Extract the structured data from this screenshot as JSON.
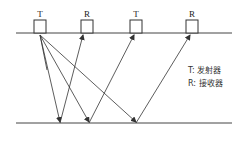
{
  "diagram": {
    "transducers": [
      {
        "label": "T",
        "type": "transmitter"
      },
      {
        "label": "R",
        "type": "receiver"
      },
      {
        "label": "T",
        "type": "transmitter"
      },
      {
        "label": "R",
        "type": "receiver"
      }
    ],
    "legend": [
      {
        "text": "T: 发射器"
      },
      {
        "text": "R: 接收器"
      }
    ],
    "colors": {
      "line": "#333333",
      "text": "#222222"
    }
  }
}
